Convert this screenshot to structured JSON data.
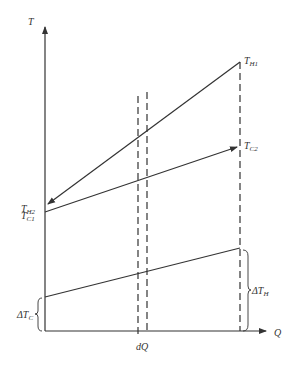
{
  "diagram": {
    "type": "temperature-heat diagram (counter-current heat exchanger)",
    "axes": {
      "y_label": "T",
      "x_label": "Q"
    },
    "curves": [
      {
        "name": "hot-stream",
        "start_label": "T_H1",
        "end_label": "T_H2",
        "direction": "right-to-left"
      },
      {
        "name": "cold-stream",
        "start_label": "T_C1",
        "end_label": "T_C2",
        "direction": "left-to-right"
      },
      {
        "name": "temperature-difference",
        "left_label": "ΔT_C",
        "right_label": "ΔT_H"
      }
    ],
    "labels": {
      "T": "T",
      "Q": "Q",
      "TH1_main": "T",
      "TH1_sub": "H1",
      "TH2_main": "T",
      "TH2_sub": "H2",
      "TC1_main": "T",
      "TC1_sub": "C1",
      "TC2_main": "T",
      "TC2_sub": "C2",
      "dTC_main": "ΔT",
      "dTC_sub": "C",
      "dTH_main": "ΔT",
      "dTH_sub": "H",
      "dQ": "dQ"
    },
    "colors": {
      "line": "#333333",
      "background": "#ffffff"
    }
  }
}
